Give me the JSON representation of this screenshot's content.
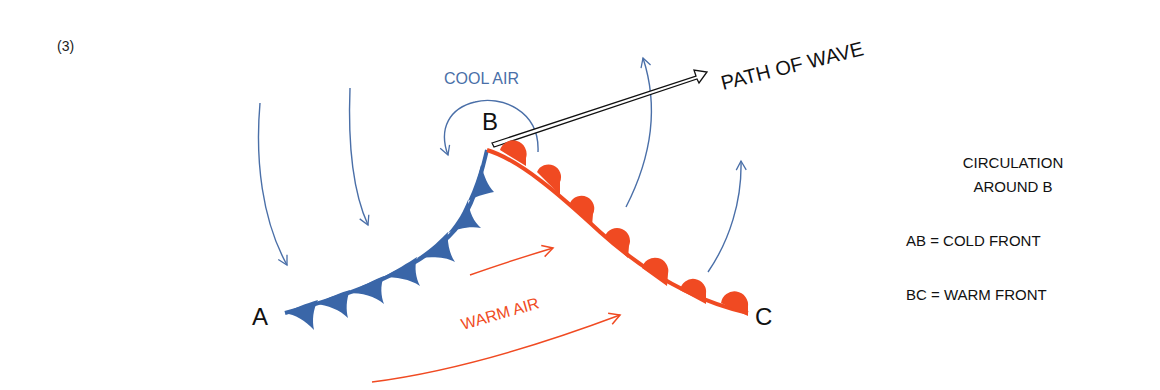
{
  "figure": {
    "panel_label": "(3)",
    "points": {
      "a": "A",
      "b": "B",
      "c": "C"
    },
    "labels": {
      "cool_air": "COOL AIR",
      "warm_air": "WARM AIR",
      "path_of_wave": "PATH OF WAVE"
    },
    "legend": {
      "circulation_line1": "CIRCULATION",
      "circulation_line2": "AROUND B",
      "cold_front": "AB = COLD FRONT",
      "warm_front": "BC = WARM FRONT"
    },
    "colors": {
      "cold": "#3a66a8",
      "cold_arrow": "#4a6fa8",
      "warm": "#f04a22",
      "text": "#111111"
    }
  }
}
